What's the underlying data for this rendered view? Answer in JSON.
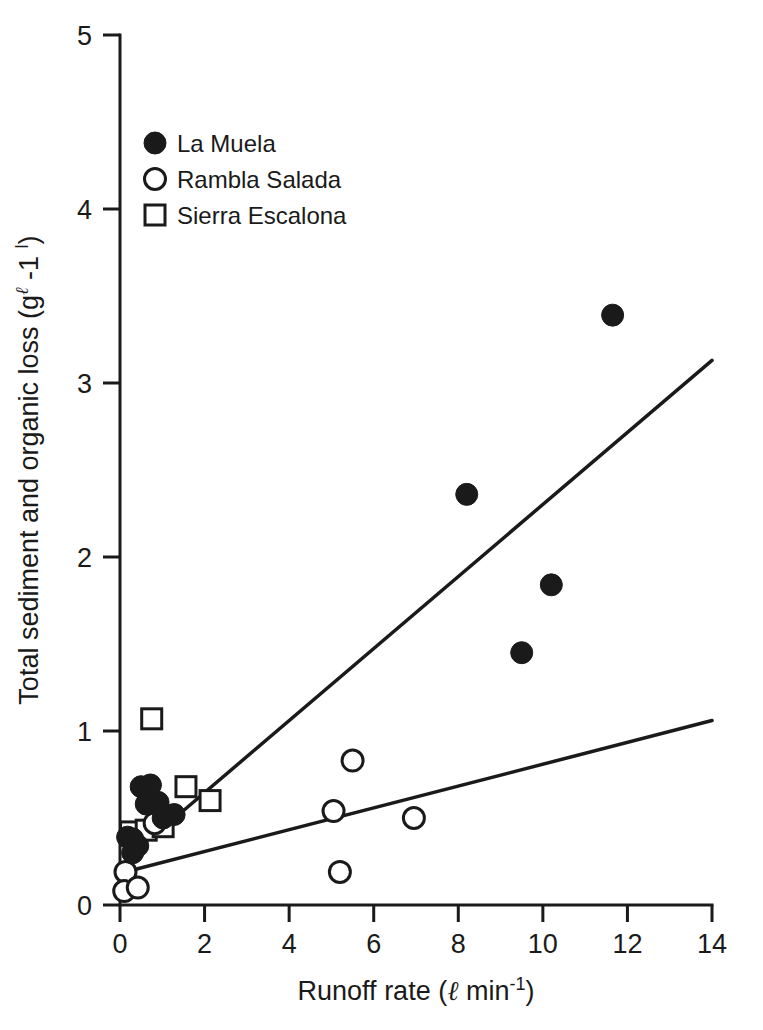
{
  "chart_data": {
    "type": "scatter",
    "title": "",
    "xlabel": "Runoff rate (ℓ min⁻¹)",
    "xlabel_parts": {
      "text_before": "Runoff rate (",
      "ell": "ℓ",
      "unit": " min",
      "exponent": "-1",
      "text_after": ")"
    },
    "ylabel": "Total sediment and organic loss (gℓ -1 l)",
    "ylabel_parts": {
      "text_before": "Total sediment and organic loss (g",
      "sup_ell": "ℓ",
      "mid": " -1 ",
      "sup_l": "l",
      "text_after": ")"
    },
    "xlim": [
      0,
      14
    ],
    "ylim": [
      0,
      5
    ],
    "xticks": [
      0,
      2,
      4,
      6,
      8,
      10,
      12,
      14
    ],
    "yticks": [
      0,
      1,
      2,
      3,
      4,
      5
    ],
    "xtick_labels": [
      "0",
      "2",
      "4",
      "6",
      "8",
      "10",
      "12",
      "14"
    ],
    "ytick_labels": [
      "0",
      "1",
      "2",
      "3",
      "4",
      "5"
    ],
    "grid": false,
    "legend_position": "upper-left",
    "legend": [
      {
        "label": "La Muela",
        "marker": "filled-circle"
      },
      {
        "label": "Rambla Salada",
        "marker": "open-circle"
      },
      {
        "label": "Sierra Escalona",
        "marker": "open-square"
      }
    ],
    "series": [
      {
        "name": "La Muela",
        "marker": "filled-circle",
        "points": [
          [
            0.18,
            0.39
          ],
          [
            0.3,
            0.38
          ],
          [
            0.42,
            0.34
          ],
          [
            0.3,
            0.3
          ],
          [
            0.5,
            0.68
          ],
          [
            0.72,
            0.69
          ],
          [
            0.62,
            0.58
          ],
          [
            0.9,
            0.59
          ],
          [
            1.02,
            0.5
          ],
          [
            1.28,
            0.52
          ],
          [
            8.2,
            2.36
          ],
          [
            9.5,
            1.45
          ],
          [
            10.2,
            1.84
          ],
          [
            11.65,
            3.39
          ]
        ]
      },
      {
        "name": "Rambla Salada",
        "marker": "open-circle",
        "points": [
          [
            0.13,
            0.19
          ],
          [
            0.1,
            0.08
          ],
          [
            0.42,
            0.1
          ],
          [
            0.82,
            0.47
          ],
          [
            5.05,
            0.54
          ],
          [
            5.5,
            0.83
          ],
          [
            5.2,
            0.19
          ],
          [
            6.95,
            0.5
          ]
        ]
      },
      {
        "name": "Sierra Escalona",
        "marker": "open-square",
        "points": [
          [
            0.25,
            0.42
          ],
          [
            0.75,
            1.07
          ],
          [
            0.62,
            0.43
          ],
          [
            1.02,
            0.45
          ],
          [
            1.56,
            0.68
          ],
          [
            2.13,
            0.6
          ]
        ]
      }
    ],
    "fit_lines": [
      {
        "name": "steep-regression-line",
        "x0": 1.15,
        "y0": 0.47,
        "x1": 14.0,
        "y1": 3.13
      },
      {
        "name": "shallow-regression-line",
        "x0": 0.05,
        "y0": 0.185,
        "x1": 14.0,
        "y1": 1.06
      }
    ]
  },
  "colors": {
    "ink": "#1a1a1a",
    "background": "#ffffff"
  }
}
